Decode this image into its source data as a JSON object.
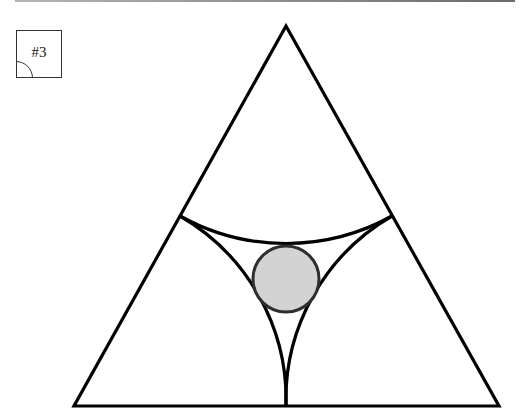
{
  "figure": {
    "label": "#3",
    "colors": {
      "stroke": "#000000",
      "circle_fill": "#d3d3d3",
      "circle_stroke": "#2e2e2e",
      "background": "#ffffff"
    },
    "triangle": {
      "apex": [
        286,
        26
      ],
      "bottom_left": [
        74,
        406
      ],
      "bottom_right": [
        499,
        406
      ]
    },
    "arcs": [
      {
        "name": "top-arc",
        "from": [
          180,
          216
        ],
        "to": [
          392,
          216
        ],
        "center": [
          286,
          26
        ],
        "radius": 218
      },
      {
        "name": "left-arc",
        "from": [
          180,
          216
        ],
        "to": [
          286,
          406
        ],
        "center": [
          74,
          406
        ],
        "radius": 212
      },
      {
        "name": "right-arc",
        "from": [
          392,
          216
        ],
        "to": [
          286,
          406
        ],
        "center": [
          499,
          406
        ],
        "radius": 212
      }
    ],
    "inscribed_circle": {
      "center": [
        286,
        279
      ],
      "radius": 33
    }
  }
}
